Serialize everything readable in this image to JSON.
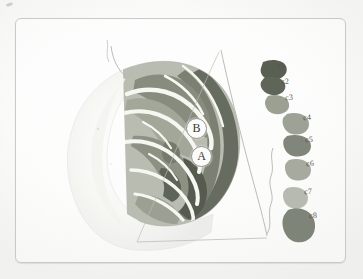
{
  "figure": {
    "title": "",
    "frame_color": "#c9c9c6",
    "paper_color": "#fdfdfc"
  },
  "markers": [
    {
      "id": "marker-b",
      "label": "B",
      "x": 196,
      "y": 127
    },
    {
      "id": "marker-a",
      "label": "A",
      "x": 201,
      "y": 155
    }
  ],
  "cortex_bands": [
    {
      "name": "band-outer-rim",
      "color": "#6f7468"
    },
    {
      "name": "band-upper-dark",
      "color": "#7c8173"
    },
    {
      "name": "band-mid-gray",
      "color": "#8d9184"
    },
    {
      "name": "band-inner-pale",
      "color": "#a8ab9e"
    },
    {
      "name": "band-deep-dark",
      "color": "#5e6357"
    },
    {
      "name": "sulcus-white",
      "color": "#f6f6f1"
    }
  ],
  "head_silhouette": {
    "name": "head-profile",
    "fill": "#f1f1ee",
    "stroke": "#dedddb"
  },
  "outline_lines": {
    "diagonal_stroke": "#b9b9b4",
    "jagged_stroke": "#b9b9b4"
  },
  "legend": {
    "name": "color-key",
    "items": [
      {
        "label": "c1",
        "color": "#5a5f53",
        "lx": 277,
        "ly": 65
      },
      {
        "label": "c2",
        "color": "#60655a",
        "lx": 281,
        "ly": 79
      },
      {
        "label": "c3",
        "color": "#9ba093",
        "lx": 285,
        "ly": 95
      },
      {
        "label": "c4",
        "color": "#9da296",
        "lx": 301,
        "ly": 116
      },
      {
        "label": "c5",
        "color": "#81867a",
        "lx": 305,
        "ly": 136
      },
      {
        "label": "c6",
        "color": "#a6aa9f",
        "lx": 307,
        "ly": 159
      },
      {
        "label": "c7",
        "color": "#b6bab1",
        "lx": 305,
        "ly": 186
      },
      {
        "label": "c8",
        "color": "#7f8478",
        "lx": 310,
        "ly": 211
      }
    ]
  }
}
